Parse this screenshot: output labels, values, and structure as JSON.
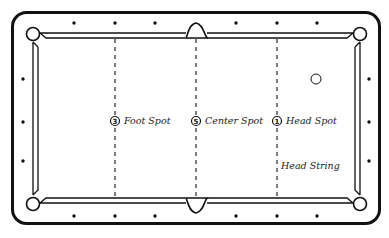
{
  "diagram": {
    "spots": [
      {
        "id": "foot",
        "number": "3",
        "label": "Foot Spot",
        "x": 115
      },
      {
        "id": "center",
        "number": "5",
        "label": "Center Spot",
        "x": 196
      },
      {
        "id": "head",
        "number": "1",
        "label": "Head Spot",
        "x": 277
      }
    ],
    "head_string_label": "Head String",
    "cue_ball": {
      "x": 316,
      "y": 79
    },
    "colors": {
      "line": "#111111",
      "background": "#ffffff"
    },
    "diamonds": {
      "top": [
        74,
        115,
        155,
        236,
        277,
        317
      ],
      "bottom": [
        74,
        115,
        155,
        236,
        277,
        317
      ],
      "left": [
        79,
        122,
        161
      ],
      "right": [
        79,
        122,
        161
      ]
    }
  }
}
